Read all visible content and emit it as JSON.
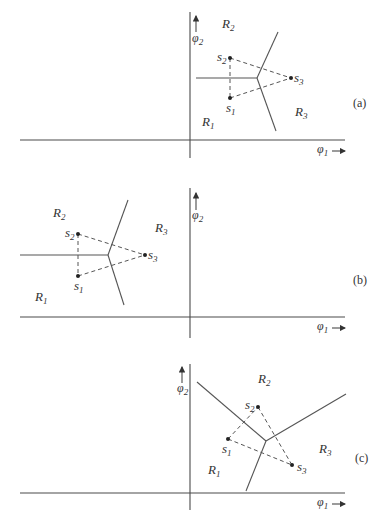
{
  "figure": {
    "axis_x_label": "φ",
    "axis_x_sub": "1",
    "axis_y_label": "φ",
    "axis_y_sub": "2",
    "panels": [
      {
        "id": "a",
        "label": "(a)",
        "regions": [
          {
            "name": "R",
            "sub": "1"
          },
          {
            "name": "R",
            "sub": "2"
          },
          {
            "name": "R",
            "sub": "3"
          }
        ],
        "points": [
          {
            "name": "s",
            "sub": "1"
          },
          {
            "name": "s",
            "sub": "2"
          },
          {
            "name": "s",
            "sub": "3"
          }
        ]
      },
      {
        "id": "b",
        "label": "(b)",
        "regions": [
          {
            "name": "R",
            "sub": "1"
          },
          {
            "name": "R",
            "sub": "2"
          },
          {
            "name": "R",
            "sub": "3"
          }
        ],
        "points": [
          {
            "name": "s",
            "sub": "1"
          },
          {
            "name": "s",
            "sub": "2"
          },
          {
            "name": "s",
            "sub": "3"
          }
        ]
      },
      {
        "id": "c",
        "label": "(c)",
        "regions": [
          {
            "name": "R",
            "sub": "1"
          },
          {
            "name": "R",
            "sub": "2"
          },
          {
            "name": "R",
            "sub": "3"
          }
        ],
        "points": [
          {
            "name": "s",
            "sub": "1"
          },
          {
            "name": "s",
            "sub": "2"
          },
          {
            "name": "s",
            "sub": "3"
          }
        ]
      }
    ]
  }
}
